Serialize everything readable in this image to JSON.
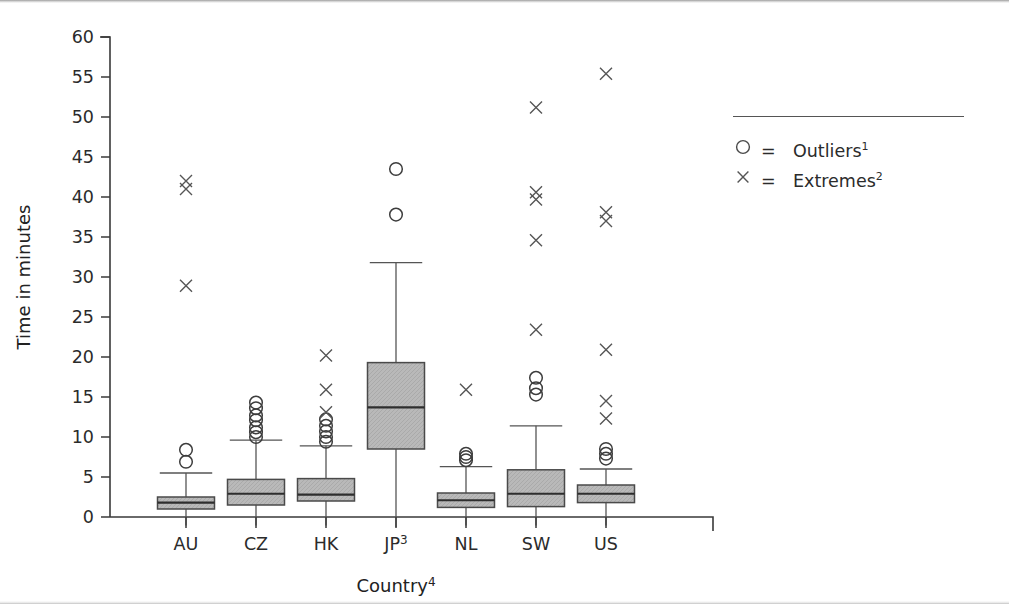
{
  "chart_data": {
    "type": "box",
    "title": "",
    "xlabel": "Country",
    "xlabel_sup": "4",
    "ylabel": "Time in minutes",
    "ylim": [
      0,
      60
    ],
    "ytick_step": 5,
    "yticks": [
      60,
      55,
      50,
      45,
      40,
      35,
      30,
      25,
      20,
      15,
      10,
      5,
      0
    ],
    "grid": false,
    "legend_position": "right",
    "categories": [
      "AU",
      "CZ",
      "HK",
      "JP",
      "NL",
      "SW",
      "US"
    ],
    "category_labels": [
      "AU",
      "CZ",
      "HK",
      "JP3",
      "NL",
      "SW",
      "US"
    ],
    "boxes": [
      {
        "category": "AU",
        "label": "AU",
        "label_sup": "",
        "whisker_low": 0.2,
        "q1": 1.0,
        "median": 1.8,
        "q3": 2.5,
        "whisker_high": 5.5,
        "outliers": [
          6.9,
          8.4
        ],
        "extremes": [
          28.9,
          41.0,
          42.0
        ]
      },
      {
        "category": "CZ",
        "label": "CZ",
        "label_sup": "",
        "whisker_low": 0.2,
        "q1": 1.5,
        "median": 2.9,
        "q3": 4.7,
        "whisker_high": 9.6,
        "outliers": [
          10.0,
          10.6,
          11.2,
          12.1,
          12.7,
          13.6,
          14.3
        ],
        "extremes": []
      },
      {
        "category": "HK",
        "label": "HK",
        "label_sup": "",
        "whisker_low": 0.2,
        "q1": 2.0,
        "median": 2.8,
        "q3": 4.8,
        "whisker_high": 8.9,
        "outliers": [
          9.4,
          10.0,
          10.7,
          11.4,
          12.2
        ],
        "extremes": [
          13.1,
          15.9,
          20.2
        ]
      },
      {
        "category": "JP",
        "label": "JP",
        "label_sup": "3",
        "whisker_low": 0.0,
        "q1": 8.5,
        "median": 13.7,
        "q3": 19.3,
        "whisker_high": 31.8,
        "outliers": [
          37.8,
          43.5
        ],
        "extremes": []
      },
      {
        "category": "NL",
        "label": "NL",
        "label_sup": "",
        "whisker_low": 0.2,
        "q1": 1.2,
        "median": 2.1,
        "q3": 3.0,
        "whisker_high": 6.3,
        "outliers": [
          7.1,
          7.5,
          7.9
        ],
        "extremes": [
          15.9
        ]
      },
      {
        "category": "SW",
        "label": "SW",
        "label_sup": "",
        "whisker_low": 0.2,
        "q1": 1.3,
        "median": 2.9,
        "q3": 5.9,
        "whisker_high": 11.4,
        "outliers": [
          15.3,
          16.1,
          17.4
        ],
        "extremes": [
          23.4,
          34.6,
          39.7,
          40.6,
          51.2
        ]
      },
      {
        "category": "US",
        "label": "US",
        "label_sup": "",
        "whisker_low": 0.2,
        "q1": 1.8,
        "median": 2.9,
        "q3": 4.0,
        "whisker_high": 6.0,
        "outliers": [
          7.3,
          7.9,
          8.5
        ],
        "extremes": [
          12.3,
          14.5,
          20.9,
          37.0,
          38.1,
          55.4
        ]
      }
    ]
  },
  "legend": {
    "rows": [
      {
        "glyph": "circle-glyph",
        "equals": "=",
        "label": "Outliers",
        "sup": "1"
      },
      {
        "glyph": "cross-glyph",
        "equals": "=",
        "label": "Extremes",
        "sup": "2"
      }
    ]
  },
  "colors": {
    "box_fill": "#b9b9b9",
    "box_stroke": "#4a4a4a",
    "axis": "#3a3a3a",
    "text": "#2b2b2b"
  }
}
